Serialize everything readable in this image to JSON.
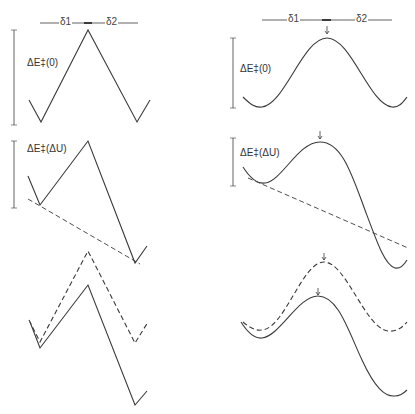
{
  "figure": {
    "type": "energy-profile-diagram",
    "colors": {
      "line": "#3a3a3a",
      "background": "#ffffff"
    },
    "left_column": {
      "style": "piecewise-linear",
      "top": {
        "label": "ΔE‡(0)",
        "delta1": "δ1",
        "delta2": "δ2"
      },
      "middle": {
        "label": "ΔE‡(ΔU)"
      },
      "bottom": {
        "label": ""
      }
    },
    "right_column": {
      "style": "smooth",
      "top": {
        "label": "ΔE‡(0)",
        "delta1": "δ1",
        "delta2": "δ2"
      },
      "middle": {
        "label": "ΔE‡(ΔU)"
      },
      "bottom": {
        "label": ""
      }
    }
  }
}
